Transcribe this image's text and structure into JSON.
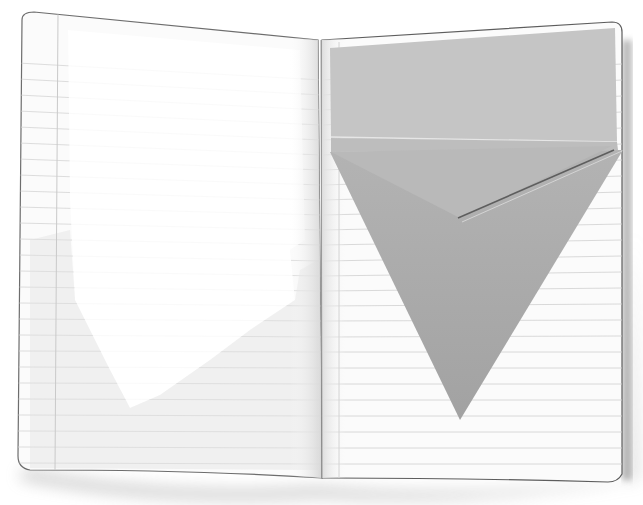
{
  "scene": {
    "description": "Open ruled notebook with an origami paper pocket folded into the right page",
    "background_color": "#ffffff",
    "paper_color": "#fbfbfb",
    "rule_color": "#cfcfcf",
    "margin_line_color": "#c8c8c8",
    "pocket_top_color": "#c4c4c4",
    "pocket_triangle_color": "#a9a9a9",
    "pocket_flap_color": "#b8b8b8",
    "shadow_color": "#7a7a7a"
  },
  "left_page": {
    "label": "left-notebook-page",
    "text": ""
  },
  "right_page": {
    "label": "right-notebook-page",
    "text": ""
  },
  "pocket": {
    "label": "origami-pocket"
  }
}
